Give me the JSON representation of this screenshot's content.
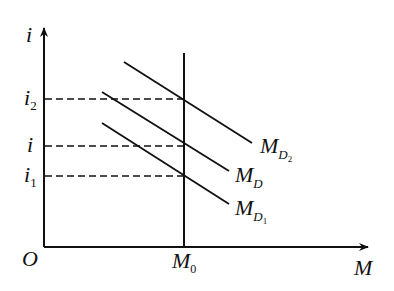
{
  "diagram": {
    "type": "money-market-equilibrium",
    "axes": {
      "origin_label": "O",
      "y_label": "i",
      "x_label": "M"
    },
    "money_supply": {
      "label": "M",
      "subscript": "0",
      "description": "vertical money supply line"
    },
    "demand_curves": [
      {
        "label": "M",
        "subscript": "D",
        "subsub": "2",
        "name": "MD2"
      },
      {
        "label": "M",
        "subscript": "D",
        "subsub": "",
        "name": "MD"
      },
      {
        "label": "M",
        "subscript": "D",
        "subsub": "1",
        "name": "MD1"
      }
    ],
    "interest_rates": [
      {
        "label": "i",
        "subscript": "2"
      },
      {
        "label": "i",
        "subscript": ""
      },
      {
        "label": "i",
        "subscript": "1"
      }
    ],
    "colors": {
      "line": "#111111",
      "background": "#ffffff"
    }
  }
}
